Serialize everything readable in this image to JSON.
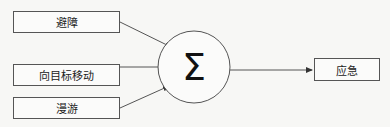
{
  "inputs": [
    {
      "label": "避障"
    },
    {
      "label": "向目标移动"
    },
    {
      "label": "漫游"
    }
  ],
  "node": {
    "symbol": "Σ"
  },
  "output": {
    "label": "应急"
  },
  "colors": {
    "stroke": "#555555",
    "background": "#f7f7f5"
  }
}
